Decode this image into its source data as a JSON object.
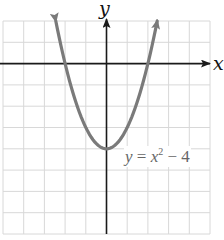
{
  "chart_data": {
    "type": "line",
    "title": "",
    "function": "y = x^2 - 4",
    "xlabel": "x",
    "ylabel": "y",
    "xlim": [
      -5,
      5
    ],
    "ylim": [
      -8,
      2
    ],
    "grid": true,
    "grid_step": 1,
    "series": [
      {
        "name": "y = x^2 - 4",
        "x": [
          -2.45,
          -2,
          -1.5,
          -1,
          -0.5,
          0,
          0.5,
          1,
          1.5,
          2,
          2.45
        ],
        "y": [
          2,
          0,
          -1.75,
          -3,
          -3.75,
          -4,
          -3.75,
          -3,
          -1.75,
          0,
          2
        ]
      }
    ],
    "vertex": [
      0,
      -4
    ],
    "x_intercepts": [
      -2,
      2
    ],
    "annotations": [
      {
        "text": "y = x² − 4",
        "position": "right of vertex"
      }
    ],
    "colors": {
      "curve": "#7a7a7a",
      "axis": "#1a1a1a",
      "grid": "#d8d8d8"
    }
  },
  "labels": {
    "x_axis": "x",
    "y_axis": "y",
    "equation_lhs": "y",
    "equation_eq": " = ",
    "equation_x": "x",
    "equation_exp": "2",
    "equation_rest": " − 4"
  }
}
